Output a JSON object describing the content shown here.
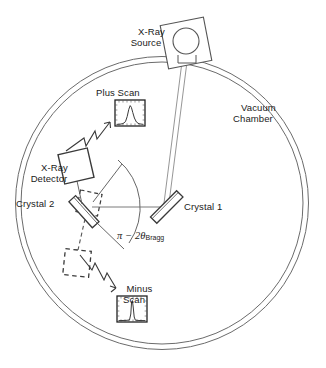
{
  "figure": {
    "background_color": "#ffffff",
    "line_color": "#555555",
    "ink_color": "#1a1a1a"
  },
  "labels": {
    "xray_source": "X-Ray\nSource",
    "vacuum_chamber": "Vacuum\nChamber",
    "plus_scan": "Plus Scan",
    "minus_scan": "Minus\nScan",
    "xray_detector": "X-Ray\nDetector",
    "crystal_1": "Crystal 1",
    "crystal_2": "Crystal 2",
    "angle_pi": "π − 2θ",
    "angle_sub": "Bragg"
  },
  "components": {
    "chamber": {
      "name": "Vacuum Chamber",
      "shape": "double-circle",
      "cx": 162,
      "cy": 203,
      "outer_r": 146,
      "inner_r": 141
    },
    "source": {
      "name": "X-Ray Source",
      "shape": "rotated-square-with-circle",
      "x": 186,
      "y": 43,
      "size": 44,
      "rotation_deg": -12,
      "circle_r": 13
    },
    "crystal1": {
      "name": "Crystal 1",
      "shape": "slab",
      "x": 166,
      "y": 207,
      "length": 36,
      "width": 9,
      "rotation_deg": -45
    },
    "crystal2": {
      "name": "Crystal 2",
      "shape": "slab",
      "x": 84,
      "y": 211,
      "length": 34,
      "width": 9,
      "rotation_deg": 48
    },
    "crystal2_ghost_plus": {
      "name": "Crystal 2 alternate (plus)",
      "shape": "dashed-square",
      "x": 87,
      "y": 205,
      "size": 22,
      "rotation_deg": 10
    },
    "crystal2_ghost_minus": {
      "name": "Crystal 2 alternate (minus)",
      "shape": "dashed-square",
      "x": 77,
      "y": 262,
      "size": 25,
      "rotation_deg": 5
    },
    "detector": {
      "name": "X-Ray Detector",
      "shape": "rotated-square",
      "x": 76,
      "y": 165,
      "size": 30,
      "rotation_deg": -14
    }
  },
  "beams": [
    {
      "name": "source-to-crystal1",
      "from": [
        186,
        50
      ],
      "to": [
        166,
        206
      ],
      "style": "solid-double"
    },
    {
      "name": "crystal1-to-crystal2",
      "from": [
        160,
        207
      ],
      "to": [
        90,
        208
      ],
      "style": "solid"
    },
    {
      "name": "crystal2-to-detector",
      "from": [
        83,
        205
      ],
      "to": [
        78,
        180
      ],
      "style": "solid"
    },
    {
      "name": "crystal2-to-ghost-minus",
      "from": [
        84,
        217
      ],
      "to": [
        77,
        252
      ],
      "style": "dashed"
    }
  ],
  "angle_arc": {
    "name": "pi-minus-2-theta-bragg",
    "vertex": [
      84,
      211
    ],
    "leg_a_end": [
      120,
      163
    ],
    "leg_b_end": [
      122,
      250
    ],
    "arc_radius": 58,
    "label": "π − 2θBragg"
  },
  "scan_plots": [
    {
      "name": "plus-scan",
      "title": "Plus Scan",
      "box": {
        "x": 115,
        "y": 100,
        "w": 29,
        "h": 25
      },
      "peak": {
        "type": "broad",
        "center": 0.52,
        "width": 0.22,
        "height": 0.78
      },
      "ticks": {
        "top": 7,
        "bottom": 7,
        "left": 5,
        "right": 5
      }
    },
    {
      "name": "minus-scan",
      "title": "Minus\nScan",
      "box": {
        "x": 117,
        "y": 296,
        "w": 29,
        "h": 25
      },
      "peak": {
        "type": "narrow",
        "center": 0.5,
        "width": 0.07,
        "height": 0.86
      },
      "ticks": {
        "top": 7,
        "bottom": 7,
        "left": 5,
        "right": 5
      }
    }
  ],
  "zigzag_arrows": [
    {
      "name": "plus-scan-arrow",
      "from": [
        66,
        150
      ],
      "to": [
        112,
        118
      ]
    },
    {
      "name": "minus-scan-arrow",
      "from": [
        79,
        254
      ],
      "to": [
        113,
        292
      ]
    }
  ],
  "label_positions": {
    "xray_source": {
      "x": 126,
      "y": 18
    },
    "vacuum_chamber": {
      "x": 226,
      "y": 96
    },
    "plus_scan": {
      "x": 98,
      "y": 88
    },
    "minus_scan": {
      "x": 117,
      "y": 272
    },
    "xray_detector": {
      "x": 27,
      "y": 152
    },
    "crystal_1": {
      "x": 186,
      "y": 202
    },
    "crystal_2": {
      "x": 18,
      "y": 198
    },
    "angle_label": {
      "x": 107,
      "y": 219
    }
  }
}
